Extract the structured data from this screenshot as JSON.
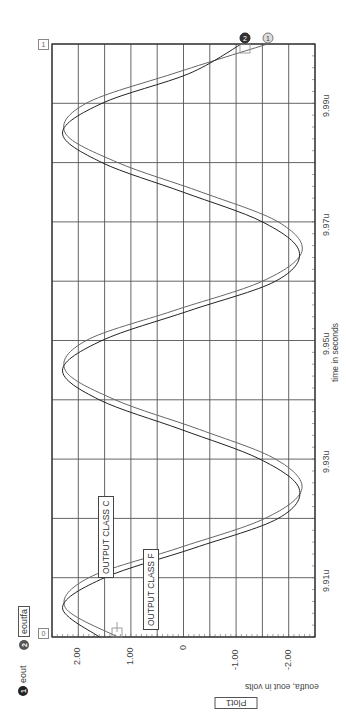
{
  "chart_data": {
    "type": "line",
    "orientation": "rotated-90-ccw",
    "title": "Plot1",
    "xlabel": "time in seconds",
    "ylabel": "eoutfa, eout in volts",
    "x_unit": "u",
    "xlim": [
      9.9,
      10.0
    ],
    "ylim": [
      -2.5,
      2.5
    ],
    "x_ticks": [
      "9.91u",
      "9.93u",
      "9.95u",
      "9.97u",
      "9.99u"
    ],
    "x_tick_values": [
      9.91,
      9.93,
      9.95,
      9.97,
      9.99
    ],
    "y_ticks": [
      "2.00",
      "1.00",
      "0",
      "-1.00",
      "-2.00"
    ],
    "y_tick_values": [
      2.0,
      1.0,
      0.0,
      -1.0,
      -2.0
    ],
    "grid": true,
    "legend": [
      {
        "id": "1",
        "name": "eout",
        "color": "#555555"
      },
      {
        "id": "2",
        "name": "eoutfa",
        "color": "#333333"
      }
    ],
    "series": [
      {
        "name": "eout",
        "marker": "1",
        "x": [
          9.9,
          9.905,
          9.91,
          9.915,
          9.92,
          9.925,
          9.93,
          9.935,
          9.94,
          9.945,
          9.95,
          9.955,
          9.96,
          9.965,
          9.97,
          9.975,
          9.98,
          9.985,
          9.99,
          9.995,
          10.0
        ],
        "values": [
          1.25,
          2.25,
          1.8,
          0.1,
          -1.55,
          -2.25,
          -1.75,
          -0.3,
          1.3,
          2.25,
          1.85,
          0.2,
          -1.5,
          -2.25,
          -1.8,
          -0.35,
          1.25,
          2.25,
          1.85,
          0.2,
          -1.6
        ]
      },
      {
        "name": "eoutfa",
        "marker": "2",
        "x": [
          9.9,
          9.905,
          9.91,
          9.915,
          9.92,
          9.925,
          9.93,
          9.935,
          9.94,
          9.945,
          9.95,
          9.955,
          9.96,
          9.965,
          9.97,
          9.975,
          9.98,
          9.985,
          9.99,
          9.995,
          10.0
        ],
        "values": [
          1.6,
          2.3,
          1.5,
          -0.2,
          -1.8,
          -2.2,
          -1.45,
          0.05,
          1.6,
          2.3,
          1.55,
          -0.1,
          -1.75,
          -2.2,
          -1.5,
          0.0,
          1.55,
          2.3,
          1.55,
          -0.1,
          -1.1
        ]
      }
    ],
    "annotations": [
      {
        "text": "OUTPUT CLASS C",
        "x": 9.915,
        "y": 1.8
      },
      {
        "text": "OUTPUT CLASS F",
        "x": 9.908,
        "y": 0.65
      }
    ],
    "corner_markers": {
      "start": "0",
      "end": "1"
    }
  },
  "legend": {
    "item1": {
      "num": "1",
      "label": "eout"
    },
    "item2": {
      "num": "2",
      "label": "eoutfa"
    }
  },
  "labels": {
    "plot_title": "Plot1",
    "y_axis_label": "eoutfa, eout in volts",
    "x_axis_label": "time in seconds",
    "annot_c": "OUTPUT CLASS C",
    "annot_f": "OUTPUT CLASS F",
    "corner_start": "0",
    "corner_end": "1",
    "marker1": "1",
    "marker2": "2"
  }
}
